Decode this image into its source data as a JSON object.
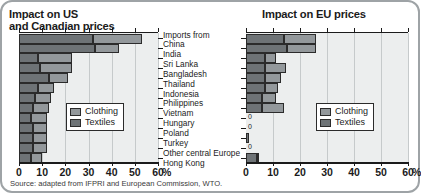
{
  "frame": {
    "border_color": "#9ea3a6"
  },
  "titles": {
    "left": "Impact on US\nand Canadian prices",
    "right": "Impact on EU prices"
  },
  "labels_header": "Imports from",
  "source": "Source: adapted from IFPRI and European Commission, WTO.",
  "legend": {
    "clothing": "Clothing",
    "textiles": "Textiles"
  },
  "colors": {
    "clothing": "#93989b",
    "textiles": "#6e7376",
    "panel": "#eceeee",
    "grid": "#c6cacb",
    "axis": "#1b1b1b"
  },
  "axis": {
    "ticks": [
      "0",
      "10",
      "20",
      "30",
      "40",
      "50",
      "60"
    ],
    "unit": "%",
    "min": 0,
    "max": 60
  },
  "chart_data": [
    {
      "type": "bar",
      "title": "Impact on US and Canadian prices",
      "orientation": "horizontal",
      "stacked": true,
      "xlabel": "%",
      "ylabel": "Imports from",
      "xlim": [
        0,
        60
      ],
      "grid": true,
      "legend": "inside-center",
      "categories": [
        "China",
        "India",
        "Sri Lanka",
        "Bangladesh",
        "Thailand",
        "Indonesia",
        "Philippines",
        "Vietnam",
        "Hungary",
        "Poland",
        "Turkey",
        "Other central Europe",
        "Hong Kong"
      ],
      "series": [
        {
          "name": "Textiles",
          "values": [
            32,
            33,
            8,
            9,
            13,
            8,
            7,
            6,
            5,
            6,
            6,
            6,
            5
          ]
        },
        {
          "name": "Clothing",
          "values": [
            21,
            10,
            15,
            14,
            8,
            7,
            7,
            7,
            7,
            6,
            6,
            6,
            5
          ]
        }
      ],
      "totals": [
        53,
        43,
        23,
        23,
        21,
        15,
        14,
        13,
        12,
        12,
        12,
        12,
        10
      ]
    },
    {
      "type": "bar",
      "title": "Impact on EU prices",
      "orientation": "horizontal",
      "stacked": true,
      "xlabel": "%",
      "xlim": [
        0,
        60
      ],
      "grid": true,
      "legend": "inside-center",
      "categories": [
        "China",
        "India",
        "Sri Lanka",
        "Bangladesh",
        "Thailand",
        "Indonesia",
        "Philippines",
        "Vietnam",
        "Hungary",
        "Poland",
        "Turkey",
        "Other central Europe",
        "Hong Kong"
      ],
      "series": [
        {
          "name": "Textiles",
          "values": [
            14,
            15,
            7,
            7,
            7,
            7,
            6,
            6,
            0,
            0,
            1,
            0,
            4
          ]
        },
        {
          "name": "Clothing",
          "values": [
            12,
            11,
            4,
            8,
            6,
            5,
            5,
            8,
            0,
            0,
            0,
            0,
            1
          ]
        }
      ],
      "totals": [
        26,
        26,
        11,
        15,
        13,
        12,
        11,
        14,
        0,
        0,
        1,
        0,
        5
      ],
      "zero_labels": {
        "Hungary": "0",
        "Poland": "0",
        "Other central Europe": "0"
      }
    }
  ]
}
